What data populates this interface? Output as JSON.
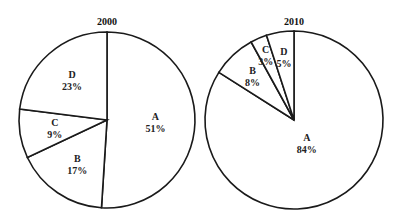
{
  "chart_data": [
    {
      "type": "pie",
      "title": "2000",
      "categories": [
        "A",
        "B",
        "C",
        "D"
      ],
      "values": [
        51,
        17,
        9,
        23
      ],
      "labels": [
        "51%",
        "17%",
        "9%",
        "23%"
      ],
      "start_angle": "12 o'clock, clockwise"
    },
    {
      "type": "pie",
      "title": "2010",
      "categories": [
        "A",
        "B",
        "C",
        "D"
      ],
      "values": [
        84,
        8,
        3,
        5
      ],
      "labels": [
        "84%",
        "8%",
        "3%",
        "5%"
      ],
      "start_angle": "12 o'clock, clockwise"
    }
  ]
}
